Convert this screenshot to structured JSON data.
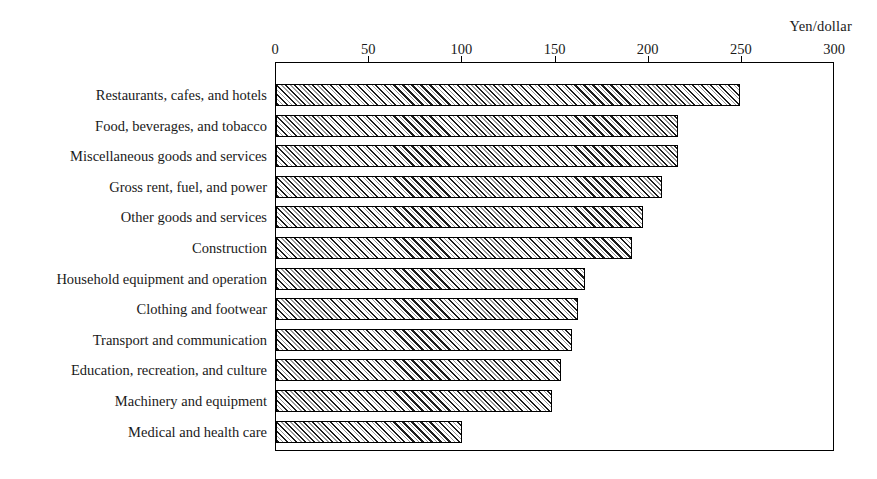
{
  "chart_data": {
    "type": "bar",
    "orientation": "horizontal",
    "title": "",
    "subtitle": "",
    "axis_unit_title": "Yen/dollar",
    "xlabel": "",
    "ylabel": "",
    "xlim": [
      0,
      300
    ],
    "xticks": [
      0,
      50,
      100,
      150,
      200,
      250,
      300
    ],
    "xtick_labels": [
      "0",
      "50",
      "100",
      "150",
      "200",
      "250",
      "300"
    ],
    "grid": false,
    "legend": null,
    "legend_position": "none",
    "annotations": [],
    "categories": [
      "Restaurants, cafes, and hotels",
      "Food, beverages, and tobacco",
      "Miscellaneous goods and services",
      "Gross rent, fuel, and power",
      "Other goods and services",
      "Construction",
      "Household equipment and operation",
      "Clothing and footwear",
      "Transport and communication",
      "Education, recreation, and culture",
      "Machinery and equipment",
      "Medical and health care"
    ],
    "values": [
      249,
      216,
      216,
      207,
      197,
      191,
      166,
      162,
      159,
      153,
      148,
      100
    ],
    "bar_fill_pattern": "diagonal-hatch",
    "bar_edge_color": "#000000",
    "bar_fill_color": "#e8e8e8"
  }
}
